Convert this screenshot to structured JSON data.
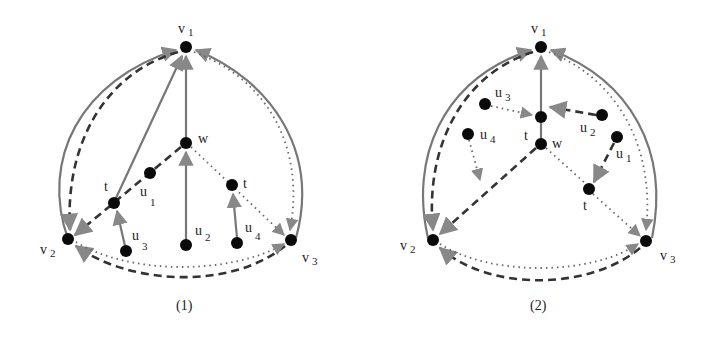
{
  "figures": [
    {
      "caption": "(1)",
      "labels": {
        "v1": {
          "base": "v",
          "sub": "1"
        },
        "v2": {
          "base": "v",
          "sub": "2"
        },
        "v3": {
          "base": "v",
          "sub": "3"
        },
        "w": {
          "base": "w",
          "sub": ""
        },
        "t_left": {
          "base": "t",
          "sub": ""
        },
        "t_right": {
          "base": "t",
          "sub": ""
        },
        "u1": {
          "base": "u",
          "sub": "1"
        },
        "u2": {
          "base": "u",
          "sub": "2"
        },
        "u3": {
          "base": "u",
          "sub": "3"
        },
        "u4": {
          "base": "u",
          "sub": "4"
        }
      }
    },
    {
      "caption": "(2)",
      "labels": {
        "v1": {
          "base": "v",
          "sub": "1"
        },
        "v2": {
          "base": "v",
          "sub": "2"
        },
        "v3": {
          "base": "v",
          "sub": "3"
        },
        "w": {
          "base": "w",
          "sub": ""
        },
        "t_top": {
          "base": "t",
          "sub": ""
        },
        "t_bottom": {
          "base": "t",
          "sub": ""
        },
        "u1": {
          "base": "u",
          "sub": "1"
        },
        "u2": {
          "base": "u",
          "sub": "2"
        },
        "u3": {
          "base": "u",
          "sub": "3"
        },
        "u4": {
          "base": "u",
          "sub": "4"
        }
      }
    }
  ],
  "legend_styles": {
    "solid": "#777777",
    "dashed": "#333333",
    "dotted": "#666666"
  }
}
